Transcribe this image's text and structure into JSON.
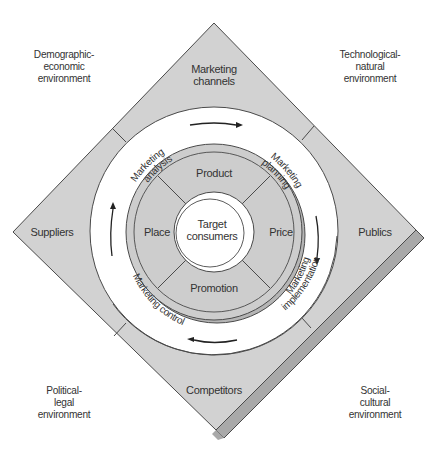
{
  "diagram": {
    "colors": {
      "diamond_fill": "#d2d2d2",
      "diamond_shadow": "#a9a9a9",
      "outline": "#4a4a4a",
      "ring_white": "#ffffff",
      "inner_disc": "#cdcdcd",
      "inner_disc_rim": "#b5b5b5",
      "text": "#333333"
    },
    "environments": {
      "top_left": {
        "line1": "Demographic-",
        "line2": "economic",
        "line3": "environment"
      },
      "top_right": {
        "line1": "Technological-",
        "line2": "natural",
        "line3": "environment"
      },
      "bottom_left": {
        "line1": "Political-",
        "line2": "legal",
        "line3": "environment"
      },
      "bottom_right": {
        "line1": "Social-",
        "line2": "cultural",
        "line3": "environment"
      }
    },
    "actors": {
      "top": {
        "line1": "Marketing",
        "line2": "channels"
      },
      "left": "Suppliers",
      "right": "Publics",
      "bottom": "Competitors"
    },
    "process_ring": {
      "analysis": {
        "line1": "Marketing",
        "line2": "analysis"
      },
      "planning": {
        "line1": "Marketing",
        "line2": "planning"
      },
      "implementation": {
        "line1": "Marketing",
        "line2": "implementation"
      },
      "control": "Marketing control"
    },
    "marketing_mix": {
      "product": "Product",
      "price": "Price",
      "promotion": "Promotion",
      "place": "Place"
    },
    "center": {
      "line1": "Target",
      "line2": "consumers"
    }
  }
}
